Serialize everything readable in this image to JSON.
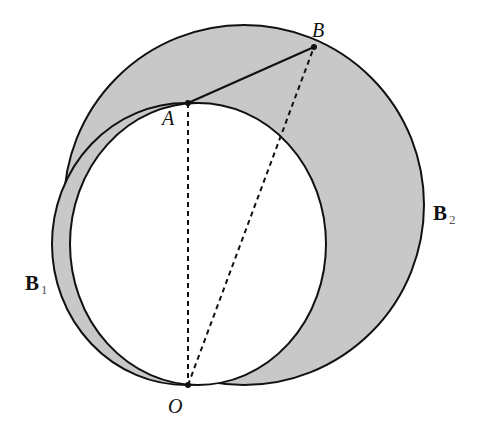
{
  "diagram": {
    "points": {
      "A": {
        "label": "A",
        "x": 188,
        "y": 103
      },
      "B": {
        "label": "B",
        "x": 314,
        "y": 47
      },
      "O": {
        "label": "O",
        "x": 188,
        "y": 385
      }
    },
    "regions": {
      "B1": {
        "label": "B",
        "sub": "1"
      },
      "B2": {
        "label": "B",
        "sub": "2"
      }
    },
    "segments": [
      {
        "from": "A",
        "to": "B",
        "style": "solid"
      },
      {
        "from": "A",
        "to": "O",
        "style": "dashed"
      },
      {
        "from": "O",
        "to": "B",
        "style": "dashed"
      }
    ],
    "colors": {
      "fill": "#c8c8c8",
      "stroke": "#111111",
      "inner": "#ffffff"
    }
  }
}
